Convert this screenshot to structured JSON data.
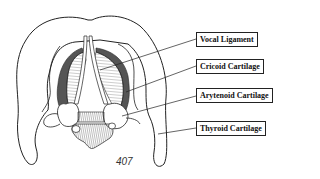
{
  "diagram": {
    "labels": [
      {
        "id": "vocal-ligament",
        "text": "Vocal Ligament"
      },
      {
        "id": "cricoid-cartilage",
        "text": "Cricoid Cartilage"
      },
      {
        "id": "arytenoid-cartilage",
        "text": "Arytenoid Cartilage"
      },
      {
        "id": "thyroid-cartilage",
        "text": "Thyroid Cartilage"
      }
    ],
    "figure_number": "407"
  },
  "colors": {
    "line": "#222222",
    "background": "#ffffff",
    "shading": "#555555"
  }
}
